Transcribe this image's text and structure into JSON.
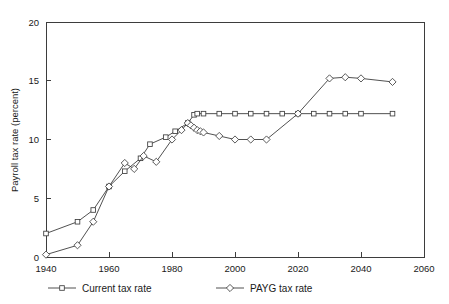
{
  "chart_data": {
    "type": "line",
    "title": "",
    "subtitle": "",
    "xlabel": "",
    "ylabel": "Payroll tax rate (percent)",
    "xlim": [
      1940,
      2060
    ],
    "ylim": [
      0,
      20
    ],
    "xticks": [
      1940,
      1960,
      1980,
      2000,
      2020,
      2040,
      2060
    ],
    "yticks": [
      0,
      5,
      10,
      15,
      20
    ],
    "grid": false,
    "legend_position": "below-axes",
    "series": [
      {
        "name": "Current tax rate",
        "marker": "square",
        "x": [
          1940,
          1950,
          1955,
          1960,
          1965,
          1970,
          1973,
          1978,
          1981,
          1985,
          1987,
          1988,
          1990,
          1995,
          2000,
          2005,
          2010,
          2015,
          2020,
          2025,
          2030,
          2035,
          2040,
          2050
        ],
        "y": [
          2.0,
          3.0,
          4.0,
          6.0,
          7.3,
          8.4,
          9.6,
          10.2,
          10.7,
          11.4,
          12.1,
          12.2,
          12.2,
          12.2,
          12.2,
          12.2,
          12.2,
          12.2,
          12.2,
          12.2,
          12.2,
          12.2,
          12.2,
          12.2
        ]
      },
      {
        "name": "PAYG tax rate",
        "marker": "diamond",
        "x": [
          1940,
          1950,
          1955,
          1960,
          1965,
          1968,
          1971,
          1975,
          1980,
          1983,
          1985,
          1986,
          1987,
          1988,
          1989,
          1990,
          1995,
          2000,
          2005,
          2010,
          2020,
          2030,
          2035,
          2040,
          2050
        ],
        "y": [
          0.2,
          1.0,
          3.0,
          6.0,
          8.0,
          7.5,
          8.6,
          8.1,
          10.0,
          10.8,
          11.4,
          11.2,
          11.0,
          10.8,
          10.7,
          10.6,
          10.3,
          10.0,
          10.0,
          10.0,
          12.2,
          15.2,
          15.3,
          15.2,
          14.9
        ]
      }
    ]
  },
  "legend": {
    "entries": [
      {
        "label": "Current tax rate",
        "marker": "square"
      },
      {
        "label": "PAYG tax rate",
        "marker": "diamond"
      }
    ]
  },
  "colors": {
    "line": "#3d3d3d",
    "axis": "#3d3d3d",
    "text": "#1a1a1a",
    "background": "#ffffff",
    "marker_fill": "#ffffff"
  }
}
